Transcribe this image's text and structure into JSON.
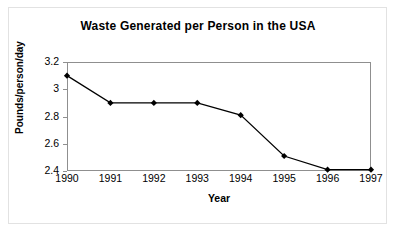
{
  "chart_data": {
    "type": "line",
    "title": "Waste Generated per Person in the USA",
    "xlabel": "Year",
    "ylabel": "Pounds/person/day",
    "categories": [
      "1990",
      "1991",
      "1992",
      "1993",
      "1994",
      "1995",
      "1996",
      "1997"
    ],
    "values": [
      3.1,
      2.9,
      2.9,
      2.9,
      2.81,
      2.51,
      2.41,
      2.41
    ],
    "ylim": [
      2.4,
      3.2
    ],
    "yticks": [
      "2.4",
      "2.6",
      "2.8",
      "3",
      "3.2"
    ],
    "ytick_values": [
      2.4,
      2.6,
      2.8,
      3.0,
      3.2
    ],
    "grid": false,
    "legend": false,
    "marker": "diamond",
    "line_color": "#000000",
    "marker_color": "#000000",
    "axis_color": "#8f8f8f",
    "border_color": "#e2e2e2",
    "background": "#ffffff"
  }
}
